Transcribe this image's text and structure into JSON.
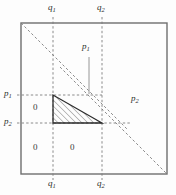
{
  "figure": {
    "type": "geometric-diagram",
    "square": {
      "x0": 21,
      "y0": 23,
      "x1": 167,
      "y1": 174
    },
    "vertical_lines": [
      {
        "id": "q1",
        "x": 53,
        "label": "q",
        "sub": "1"
      },
      {
        "id": "q2",
        "x": 102,
        "label": "q",
        "sub": "2"
      }
    ],
    "horizontal_lines": [
      {
        "id": "p1",
        "y": 95,
        "label": "p",
        "sub": "1"
      },
      {
        "id": "p2",
        "y": 123,
        "label": "p",
        "sub": "2"
      }
    ],
    "diagonals": [
      {
        "id": "diag-upper",
        "x1": 21,
        "y1": 23,
        "x2": 126,
        "y2": 128
      },
      {
        "id": "diag-lower",
        "x1": 62,
        "y1": 69,
        "x2": 167,
        "y2": 174
      }
    ],
    "triangle": {
      "id": "hatched-triangle",
      "vertices": [
        [
          53,
          95
        ],
        [
          53,
          123
        ],
        [
          102,
          123
        ]
      ],
      "hatch_angle_deg": 45
    },
    "labels": {
      "q1_top": {
        "text": "q",
        "sub": "1",
        "x": 48,
        "y": 6
      },
      "q2_top": {
        "text": "q",
        "sub": "2",
        "x": 97,
        "y": 6
      },
      "q1_bottom": {
        "text": "q",
        "sub": "1",
        "x": 48,
        "y": 180
      },
      "q2_bottom": {
        "text": "q",
        "sub": "2",
        "x": 97,
        "y": 180
      },
      "p1_left": {
        "text": "p",
        "sub": "1",
        "x": 4,
        "y": 88
      },
      "p2_left": {
        "text": "p",
        "sub": "2",
        "x": 4,
        "y": 116
      },
      "p1_inner": {
        "text": "p",
        "sub": "1",
        "x": 83,
        "y": 44
      },
      "p2_right": {
        "text": "p",
        "sub": "2",
        "x": 133,
        "y": 95
      }
    },
    "zeros": [
      {
        "id": "zero-left-upper",
        "text": "0",
        "x": 33,
        "y": 103
      },
      {
        "id": "zero-left-lower",
        "text": "0",
        "x": 33,
        "y": 143
      },
      {
        "id": "zero-center-lower",
        "text": "0",
        "x": 70,
        "y": 143
      }
    ],
    "leader": {
      "id": "p1-leader",
      "x": 89,
      "y_top": 57,
      "y_bottom": 92
    },
    "colors": {
      "frame": "#6e6e6e",
      "dash": "#7d7d7d",
      "triangle_edge": "#2b2b2b",
      "hatch": "#6a6a6a",
      "text": "#2b2b2b",
      "background": "#fdfdfd"
    }
  }
}
